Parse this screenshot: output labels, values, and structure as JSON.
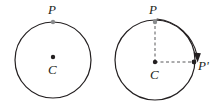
{
  "figure": {
    "background_color": "#ffffff",
    "stroke_color": "#231f20",
    "dashed_color": "#58595b",
    "point_fill": "#808285",
    "panels": [
      {
        "id": "panel-left",
        "name": "circle-before-rotation",
        "circle": {
          "cx": 53,
          "cy": 60,
          "r": 38
        },
        "center_point": {
          "cx": 53,
          "cy": 57,
          "r": 2.2
        },
        "labels": [
          {
            "name": "point-label-p",
            "text": "P",
            "x": 48,
            "y": 14
          },
          {
            "name": "center-label-c",
            "text": "C",
            "x": 48,
            "y": 74
          }
        ],
        "points": [
          {
            "name": "point-p",
            "cx": 53,
            "cy": 22,
            "r": 2.2
          }
        ]
      },
      {
        "id": "panel-right",
        "name": "circle-after-rotation",
        "circle": {
          "cx": 155,
          "cy": 60,
          "r": 40
        },
        "center_point": {
          "cx": 155,
          "cy": 62,
          "r": 2.2
        },
        "labels": [
          {
            "name": "point-label-p",
            "text": "P",
            "x": 149,
            "y": 14
          },
          {
            "name": "center-label-c",
            "text": "C",
            "x": 150,
            "y": 79
          },
          {
            "name": "point-label-p-prime",
            "text": "P'",
            "x": 198,
            "y": 70
          }
        ],
        "points": [
          {
            "name": "point-p",
            "cx": 155,
            "cy": 22,
            "r": 2.2
          },
          {
            "name": "point-p-prime",
            "cx": 194,
            "cy": 62,
            "r": 2.4
          }
        ],
        "radii": [
          {
            "name": "radius-c-to-p",
            "x1": 155,
            "y1": 62,
            "x2": 155,
            "y2": 22
          },
          {
            "name": "radius-c-to-p-prime",
            "x1": 155,
            "y1": 62,
            "x2": 194,
            "y2": 62
          }
        ],
        "rotation_arrow": {
          "name": "rotation-arc-arrow",
          "from": "P",
          "to": "P'",
          "direction": "clockwise",
          "sweep_degrees": 90
        }
      }
    ]
  }
}
